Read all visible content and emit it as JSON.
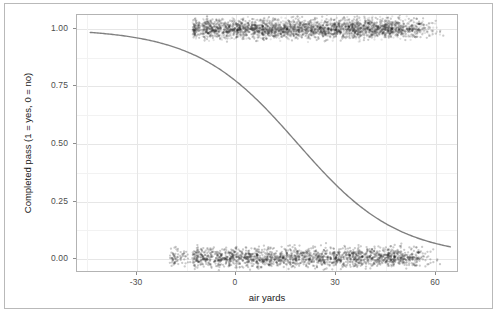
{
  "chart_data": {
    "type": "scatter",
    "title": "",
    "subtitle": "",
    "xlabel": "air yards",
    "ylabel": "Completed pass (1 = yes, 0 = no)",
    "xlim": [
      -48,
      67
    ],
    "ylim": [
      -0.06,
      1.06
    ],
    "xticks": [
      -30,
      0,
      30,
      60
    ],
    "xticklabels": [
      "-30",
      "0",
      "30",
      "60"
    ],
    "yticks": [
      0.0,
      0.25,
      0.5,
      0.75,
      1.0
    ],
    "yticklabels": [
      "0.00",
      "0.25",
      "0.50",
      "0.75",
      "1.00"
    ],
    "grid": true,
    "grid_major_color": "#e6e6e6",
    "grid_minor_color": "#f2f2f2",
    "panel_background": "#ffffff",
    "panel_border_color": "#b3b3b3",
    "legend": null,
    "legend_position": "none",
    "series": [
      {
        "name": "Completed passes (jittered, y = 1)",
        "type": "scatter",
        "marker": "circle",
        "color": "#1a1a1a",
        "alpha": 0.12,
        "y_center": 1.0,
        "y_jitter": 0.045,
        "x_range": [
          -13,
          63
        ],
        "x_dense_range": [
          -10,
          45
        ],
        "n_points": 4200
      },
      {
        "name": "Incomplete passes (jittered, y = 0)",
        "type": "scatter",
        "marker": "circle",
        "color": "#1a1a1a",
        "alpha": 0.12,
        "y_center": 0.0,
        "y_jitter": 0.045,
        "x_range": [
          -20,
          62
        ],
        "x_dense_range": [
          -13,
          46
        ],
        "n_points": 3400
      },
      {
        "name": "Logistic fit",
        "type": "line",
        "color": "#808080",
        "linewidth": 1.4,
        "model": "logistic",
        "intercept": 1.22,
        "slope": -0.0655,
        "x_start": -44,
        "x_end": 65,
        "points": [
          {
            "x": -44,
            "y": 0.982
          },
          {
            "x": -35,
            "y": 0.967
          },
          {
            "x": -25,
            "y": 0.941
          },
          {
            "x": -15,
            "y": 0.898
          },
          {
            "x": -5,
            "y": 0.826
          },
          {
            "x": 0,
            "y": 0.772
          },
          {
            "x": 5,
            "y": 0.708
          },
          {
            "x": 10,
            "y": 0.636
          },
          {
            "x": 15,
            "y": 0.558
          },
          {
            "x": 18.6,
            "y": 0.5
          },
          {
            "x": 25,
            "y": 0.398
          },
          {
            "x": 30,
            "y": 0.325
          },
          {
            "x": 35,
            "y": 0.261
          },
          {
            "x": 45,
            "y": 0.159
          },
          {
            "x": 55,
            "y": 0.092
          },
          {
            "x": 65,
            "y": 0.051
          }
        ]
      }
    ]
  },
  "figure": {
    "background": "#ffffff",
    "frame_color": "#b9b9b9"
  }
}
